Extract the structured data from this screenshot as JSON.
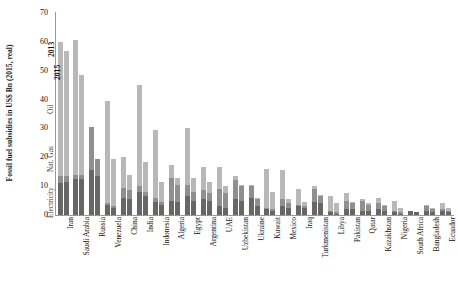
{
  "chart_data": {
    "type": "bar",
    "title": "",
    "subtitle": "",
    "xlabel": "",
    "ylabel": "Fossil fuel subsidies in US$ Bn (2015, real)",
    "ylim": [
      0,
      70
    ],
    "yticks": [
      0,
      10,
      20,
      30,
      40,
      50,
      60,
      70
    ],
    "grid": false,
    "legend_position": "inside-left-vertical",
    "stacked": true,
    "segment_names": [
      "Electricity",
      "Nat. Gas",
      "Oil"
    ],
    "segment_colors": {
      "Electricity": "#666666",
      "Nat. Gas": "#8f8f8f",
      "Oil": "#b8b8b8"
    },
    "year_labels": [
      "2013",
      "2015"
    ],
    "annotations": [
      "Electricity",
      "Nat. Gas",
      "Oil",
      "2015",
      "2013"
    ],
    "categories": [
      "Iran",
      "Saudi Arabia",
      "Russia",
      "Venezuela",
      "China",
      "India",
      "Indonesia",
      "Algeria",
      "Egypt",
      "Argentina",
      "UAE",
      "Uzbekistan",
      "Ukraine",
      "Kuwait",
      "Mexico",
      "Iraq",
      "Turkmenistan",
      "Libya",
      "Pakistan",
      "Qatar",
      "Kazakhstan",
      "Nigeria",
      "South Africa",
      "Bangladesh",
      "Ecuador"
    ],
    "series": [
      {
        "name": "2013",
        "segments": {
          "Electricity": [
            11.0,
            12.5,
            15.5,
            3.5,
            6.0,
            8.0,
            4.5,
            5.0,
            6.5,
            5.5,
            3.0,
            5.5,
            6.0,
            2.0,
            3.0,
            3.0,
            4.5,
            1.0,
            2.0,
            1.5,
            2.0,
            1.0,
            1.5,
            1.5,
            1.5
          ],
          "Nat. Gas": [
            2.5,
            1.5,
            15.0,
            0.5,
            3.5,
            2.0,
            1.5,
            8.0,
            4.0,
            3.0,
            6.0,
            6.5,
            4.0,
            0.5,
            2.5,
            0.5,
            4.5,
            0.5,
            3.0,
            3.5,
            2.0,
            0.5,
            0.0,
            1.5,
            0.5
          ],
          "Oil": [
            46.5,
            46.5,
            0.0,
            35.5,
            10.5,
            35.0,
            23.5,
            4.5,
            19.5,
            8.0,
            7.5,
            1.5,
            0.5,
            13.5,
            10.0,
            5.5,
            1.0,
            5.0,
            2.5,
            0.5,
            2.0,
            3.5,
            0.0,
            0.5,
            2.0
          ]
        },
        "totals": [
          60.0,
          60.5,
          30.5,
          39.5,
          20.0,
          45.0,
          29.5,
          17.5,
          30.0,
          16.5,
          16.5,
          13.5,
          10.5,
          16.0,
          15.5,
          9.0,
          10.0,
          6.5,
          7.5,
          5.5,
          6.0,
          5.0,
          1.5,
          3.5,
          4.0
        ]
      },
      {
        "name": "2015",
        "segments": {
          "Electricity": [
            11.5,
            12.5,
            13.5,
            2.5,
            5.5,
            6.5,
            3.5,
            4.5,
            5.0,
            5.0,
            2.5,
            5.0,
            3.0,
            1.5,
            2.5,
            2.5,
            4.0,
            0.5,
            2.0,
            1.5,
            1.5,
            0.5,
            1.0,
            1.0,
            1.0
          ],
          "Nat. Gas": [
            2.0,
            1.5,
            6.0,
            0.5,
            3.0,
            1.5,
            1.0,
            6.0,
            3.0,
            2.5,
            5.0,
            5.0,
            2.5,
            0.5,
            1.5,
            0.5,
            2.5,
            0.5,
            2.0,
            2.0,
            1.5,
            0.5,
            0.0,
            1.0,
            0.5
          ],
          "Oil": [
            43.5,
            34.5,
            0.0,
            16.5,
            5.5,
            10.5,
            7.0,
            2.5,
            5.0,
            4.0,
            2.5,
            0.5,
            0.5,
            6.0,
            1.5,
            1.5,
            0.5,
            3.0,
            0.5,
            0.5,
            0.5,
            1.5,
            0.0,
            0.5,
            1.0
          ]
        },
        "totals": [
          57.0,
          48.5,
          19.5,
          19.5,
          14.0,
          18.5,
          11.5,
          13.0,
          13.0,
          11.5,
          10.0,
          10.5,
          6.0,
          8.0,
          5.5,
          4.5,
          7.0,
          4.0,
          4.5,
          4.0,
          3.5,
          2.5,
          1.0,
          2.5,
          2.5
        ]
      }
    ]
  }
}
